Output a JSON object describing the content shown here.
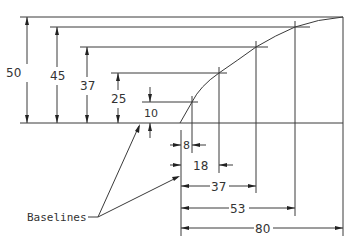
{
  "diagram": {
    "title": "",
    "annotation": {
      "label": "Baselines"
    },
    "vertical_dimensions": [
      {
        "value": "50",
        "x": 27,
        "y_top": 17,
        "label_x": 13,
        "label_y": 76
      },
      {
        "value": "45",
        "x": 57,
        "y_top": 27,
        "label_x": 57,
        "label_y": 79
      },
      {
        "value": "37",
        "x": 87,
        "y_top": 47,
        "label_x": 87,
        "label_y": 90
      },
      {
        "value": "25",
        "x": 118,
        "y_top": 73,
        "label_x": 118,
        "label_y": 103
      },
      {
        "value": "10",
        "x": 150,
        "y_top": 102,
        "label_x": 150,
        "label_y": 117
      }
    ],
    "horizontal_dimensions": [
      {
        "value": "8",
        "x_end": 192,
        "y": 145
      },
      {
        "value": "18",
        "x_end": 219,
        "y": 165
      },
      {
        "value": "37",
        "x_end": 256,
        "y": 185
      },
      {
        "value": "53",
        "x_end": 295,
        "y": 208
      },
      {
        "value": "80",
        "x_end": 343,
        "y": 228
      }
    ],
    "curve_points": [
      {
        "x": 0,
        "y": 0
      },
      {
        "x": 8,
        "y": 10
      },
      {
        "x": 18,
        "y": 25
      },
      {
        "x": 37,
        "y": 37
      },
      {
        "x": 53,
        "y": 45
      },
      {
        "x": 80,
        "y": 50
      }
    ],
    "colors": {
      "line": "#3a3a3a",
      "text": "#333333",
      "background": "#ffffff"
    }
  }
}
